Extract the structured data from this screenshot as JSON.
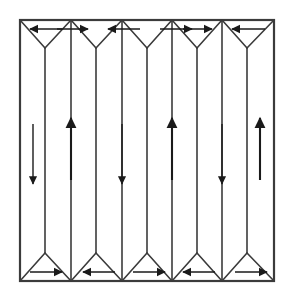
{
  "figure": {
    "type": "diagram",
    "canvas": {
      "width": 292,
      "height": 303
    },
    "background_color": "#ffffff",
    "line_color": "#3b3b3b",
    "arrow_color": "#1a1a1a"
  },
  "frame": {
    "name": "specimen-boundary",
    "left": 20,
    "top": 20,
    "right": 274,
    "bottom": 281,
    "stroke_width": 2.2,
    "color": "#3b3b3b"
  },
  "geometry": {
    "top_edge_y": 20,
    "bottom_edge_y": 281,
    "top_apex_y": 48,
    "bottom_apex_y": 253,
    "wall_x": [
      20,
      45,
      96,
      147,
      197,
      247,
      274
    ],
    "interior_apex_x": [
      45,
      96,
      147,
      197,
      247
    ],
    "vertical_wall_x": [
      20,
      45,
      71,
      96,
      122,
      147,
      172,
      197,
      222,
      247,
      274
    ]
  },
  "closure_domains": {
    "top": {
      "label": "top closure domains",
      "count": 6,
      "apex_direction": "down",
      "arrows": [
        {
          "name": "top-arrow-1",
          "direction": "left",
          "x1": 62,
          "x2": 30,
          "y": 29
        },
        {
          "name": "top-arrow-2",
          "direction": "right",
          "x1": 57,
          "x2": 88,
          "y": 29
        },
        {
          "name": "top-arrow-3",
          "direction": "left",
          "x1": 140,
          "x2": 108,
          "y": 29
        },
        {
          "name": "top-arrow-4",
          "direction": "right",
          "x1": 160,
          "x2": 192,
          "y": 29
        },
        {
          "name": "top-arrow-5",
          "direction": "right",
          "x1": 183,
          "x2": 212,
          "y": 29
        },
        {
          "name": "top-arrow-6",
          "direction": "left",
          "x1": 265,
          "x2": 232,
          "y": 29
        }
      ]
    },
    "bottom": {
      "label": "bottom closure domains",
      "count": 6,
      "apex_direction": "up",
      "arrows": [
        {
          "name": "bottom-arrow-1",
          "direction": "right",
          "x1": 30,
          "x2": 62,
          "y": 272
        },
        {
          "name": "bottom-arrow-2",
          "direction": "left",
          "x1": 115,
          "x2": 83,
          "y": 272
        },
        {
          "name": "bottom-arrow-3",
          "direction": "right",
          "x1": 133,
          "x2": 165,
          "y": 272
        },
        {
          "name": "bottom-arrow-4",
          "direction": "left",
          "x1": 215,
          "x2": 183,
          "y": 272
        },
        {
          "name": "bottom-arrow-5",
          "direction": "right",
          "x1": 235,
          "x2": 267,
          "y": 272
        }
      ]
    }
  },
  "chart_data": {
    "type": "diagram",
    "slab_domains": [
      {
        "index": 1,
        "name": "domain-1",
        "magnetization": "down",
        "center_x": 33,
        "arrow_y1": 124,
        "arrow_y2": 184,
        "weight": "thin"
      },
      {
        "index": 2,
        "name": "domain-2",
        "magnetization": "up",
        "center_x": 71,
        "arrow_y1": 180,
        "arrow_y2": 118,
        "weight": "thick"
      },
      {
        "index": 3,
        "name": "domain-3",
        "magnetization": "down",
        "center_x": 122,
        "arrow_y1": 124,
        "arrow_y2": 184,
        "weight": "thin"
      },
      {
        "index": 4,
        "name": "domain-4",
        "magnetization": "up",
        "center_x": 172,
        "arrow_y1": 180,
        "arrow_y2": 118,
        "weight": "thick"
      },
      {
        "index": 5,
        "name": "domain-5",
        "magnetization": "down",
        "center_x": 222,
        "arrow_y1": 124,
        "arrow_y2": 184,
        "weight": "thin"
      },
      {
        "index": 6,
        "name": "domain-6",
        "magnetization": "up",
        "center_x": 260,
        "arrow_y1": 180,
        "arrow_y2": 118,
        "weight": "thick"
      }
    ],
    "closure_top_directions": [
      "left",
      "right",
      "left",
      "right",
      "right",
      "left"
    ],
    "closure_bottom_directions": [
      "right",
      "left",
      "right",
      "left",
      "right"
    ]
  }
}
